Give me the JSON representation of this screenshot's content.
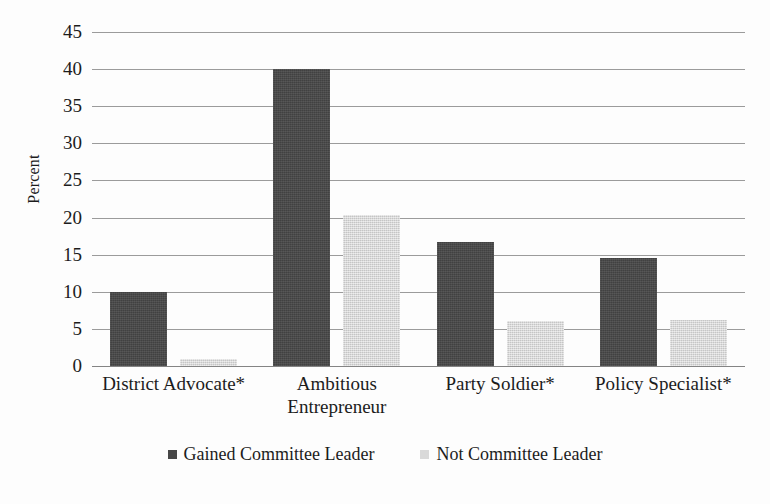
{
  "chart_data": {
    "type": "bar",
    "title": "",
    "subtitle": "",
    "xlabel": "",
    "ylabel": "Percent",
    "ylim": [
      0,
      45
    ],
    "ytick_step": 5,
    "yticks": [
      45,
      40,
      35,
      30,
      25,
      20,
      15,
      10,
      5,
      0
    ],
    "grid": true,
    "legend_position": "bottom",
    "categories": [
      "District Advocate*",
      "Ambitious Entrepreneur",
      "Party Soldier*",
      "Policy Specialist*"
    ],
    "category_lines": [
      [
        "District Advocate*"
      ],
      [
        "Ambitious",
        "Entrepreneur"
      ],
      [
        "Party Soldier*"
      ],
      [
        "Policy Specialist*"
      ]
    ],
    "series": [
      {
        "name": "Gained Committee Leader",
        "color": "#474747",
        "values": [
          10.0,
          40.0,
          16.7,
          14.6
        ]
      },
      {
        "name": "Not Committee Leader",
        "color": "#d9d9d9",
        "values": [
          1.0,
          20.4,
          6.0,
          6.2
        ]
      }
    ]
  },
  "axis": {
    "y_title": "Percent",
    "tick_labels": [
      "45",
      "40",
      "35",
      "30",
      "25",
      "20",
      "15",
      "10",
      "5",
      "0"
    ]
  },
  "legend": {
    "items": [
      {
        "label": "Gained Committee Leader",
        "swatch": "dark-square-marker"
      },
      {
        "label": "Not Committee Leader",
        "swatch": "light-square-marker"
      }
    ]
  }
}
